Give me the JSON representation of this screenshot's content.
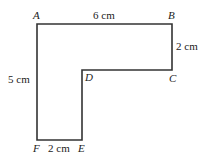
{
  "diagram": {
    "type": "L-shaped polygon",
    "stroke_color": "#333333",
    "vertices": [
      {
        "name": "A",
        "x": 37,
        "y": 24
      },
      {
        "name": "B",
        "x": 172,
        "y": 24
      },
      {
        "name": "C",
        "x": 172,
        "y": 70
      },
      {
        "name": "D",
        "x": 82,
        "y": 70
      },
      {
        "name": "E",
        "x": 82,
        "y": 140
      },
      {
        "name": "F",
        "x": 37,
        "y": 140
      }
    ],
    "labels": {
      "A": "A",
      "B": "B",
      "C": "C",
      "D": "D",
      "E": "E",
      "F": "F"
    },
    "measurements": {
      "AB": "6 cm",
      "BC": "2 cm",
      "AF": "5 cm",
      "FE": "2 cm"
    }
  }
}
